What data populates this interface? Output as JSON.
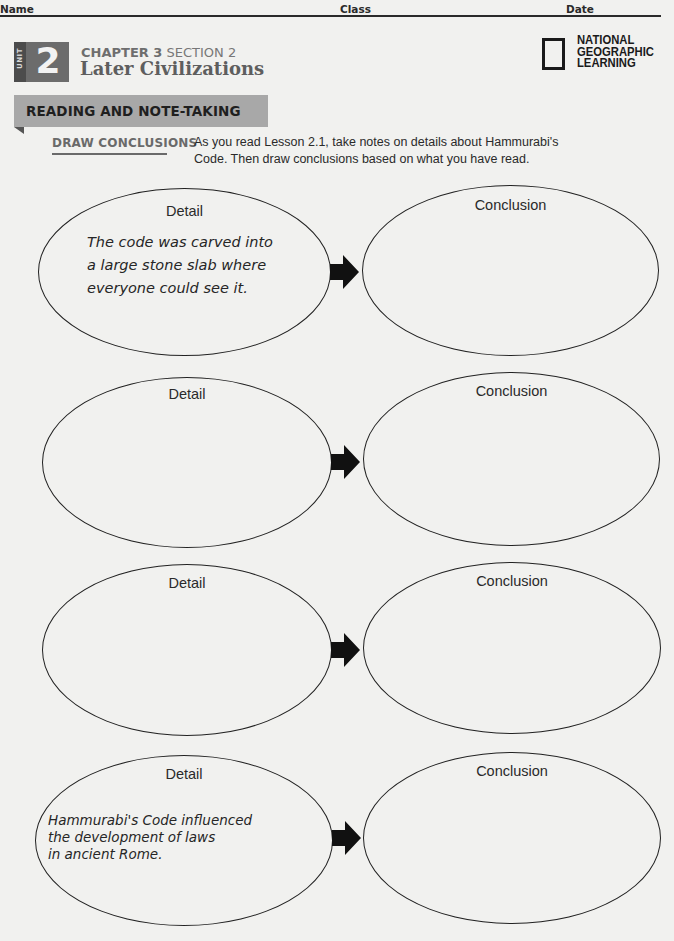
{
  "header": {
    "name_label": "Name",
    "class_label": "Class",
    "date_label": "Date"
  },
  "unit": {
    "word": "UNIT",
    "number": "2"
  },
  "chapter": {
    "chapter_label": "CHAPTER 3",
    "section_label": "SECTION 2",
    "title": "Later Civilizations"
  },
  "publisher": {
    "line1": "NATIONAL",
    "line2": "GEOGRAPHIC",
    "line3": "LEARNING"
  },
  "banner": {
    "label": "READING AND NOTE-TAKING"
  },
  "activity": {
    "skill": "DRAW CONCLUSIONS",
    "instructions": "As you read Lesson 2.1, take notes on details about Hammurabi's Code. Then draw conclusions based on what you have read."
  },
  "organizer": {
    "rows": [
      {
        "detail_title": "Detail",
        "detail_text": "The code was carved into\na large stone slab where\neveryone could see it.",
        "conclusion_title": "Conclusion",
        "conclusion_text": ""
      },
      {
        "detail_title": "Detail",
        "detail_text": "",
        "conclusion_title": "Conclusion",
        "conclusion_text": ""
      },
      {
        "detail_title": "Detail",
        "detail_text": "",
        "conclusion_title": "Conclusion",
        "conclusion_text": ""
      },
      {
        "detail_title": "Detail",
        "detail_text": "Hammurabi's Code influenced\nthe development of laws\nin ancient Rome.",
        "conclusion_title": "Conclusion",
        "conclusion_text": ""
      }
    ]
  },
  "colors": {
    "page_background": "#f1f1ef",
    "unit_box": "#6c6c6c",
    "banner": "#a8a8a8",
    "ink": "#1e1e1e"
  }
}
